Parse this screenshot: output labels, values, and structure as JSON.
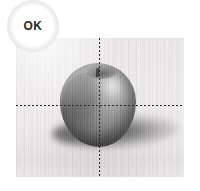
{
  "status_badge": {
    "label": "OK",
    "semantic": "pass",
    "text_color": "#2a2a2a",
    "background_color": "#ffffff",
    "ring_color": "#e6e6e6"
  },
  "image_panel": {
    "name": "inspection-image",
    "subject": "apple",
    "rendering": "grayscale-photograph",
    "background_color": "#ecebeb",
    "border_color": "#e2e0e0"
  },
  "crosshair": {
    "name": "alignment-crosshair",
    "style": "dashed",
    "color": "#2b2b2b",
    "horizontal_label": "horizontal-guide",
    "vertical_label": "vertical-guide"
  }
}
